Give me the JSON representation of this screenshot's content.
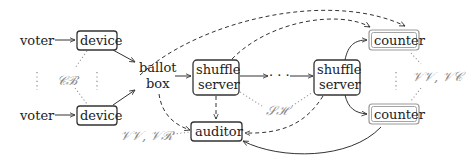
{
  "diagram": {
    "nodes": {
      "voter_top": "voter",
      "voter_bottom": "voter",
      "device_top": "device",
      "device_bottom": "device",
      "ballot_box_line1": "ballot",
      "ballot_box_line2": "box",
      "shuffle1_line1": "shuffle",
      "shuffle1_line2": "server",
      "shuffle2_line1": "shuffle",
      "shuffle2_line2": "server",
      "ellipsis": "· · ·",
      "auditor": "auditor",
      "counter_top": "counter",
      "counter_bottom": "counter"
    },
    "annotations": {
      "cb": "𝒞ℬ",
      "sh": "𝒮ℋ",
      "vv_vr": "𝒱𝒱, 𝒱ℛ",
      "vv_vc": "𝒱𝒱, 𝒱𝒞"
    },
    "colors": {
      "primary": "#333333",
      "muted": "#9a9a9a"
    }
  }
}
